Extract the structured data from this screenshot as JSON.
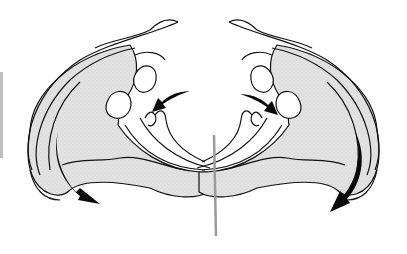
{
  "figure": {
    "colors": {
      "outline": "#111111",
      "shading": "#dcdcdc",
      "arrow": "#0a0a0a",
      "rod": "#9a9a9a",
      "background": "#ffffff"
    },
    "arrows": [
      {
        "id": "left-inner",
        "direction": "inward-down",
        "position": "upper-left-center"
      },
      {
        "id": "right-inner",
        "direction": "inward-down",
        "position": "upper-right-center"
      },
      {
        "id": "left-outer",
        "direction": "down-outward",
        "position": "lower-left"
      },
      {
        "id": "right-outer",
        "direction": "down-outward",
        "position": "lower-right"
      }
    ],
    "labels": []
  }
}
